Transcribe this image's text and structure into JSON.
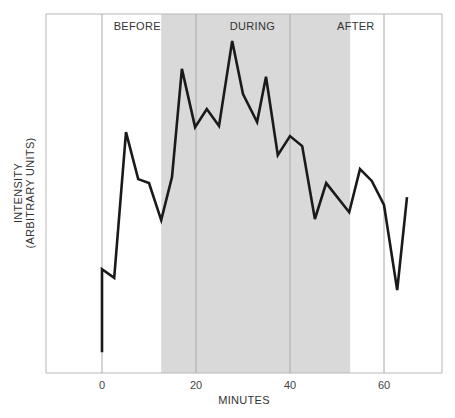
{
  "chart_data": {
    "type": "line",
    "title": "",
    "xlabel": "MINUTES",
    "ylabel": "INTENSITY",
    "ylabel_sub": "(ARBITRARY UNITS)",
    "xlim": [
      -12.5,
      72
    ],
    "ylim": [
      0,
      100
    ],
    "x_ticks": [
      0,
      20,
      40,
      60
    ],
    "y_ticks": [],
    "grid": "vertical lines at x ticks",
    "shaded_region": {
      "label": "DURING",
      "x_start": 12.6,
      "x_end": 52.8,
      "color": "#d9d9d9"
    },
    "phases": [
      {
        "label": "BEFORE",
        "x_center": 7.5
      },
      {
        "label": "DURING",
        "x_center": 32
      },
      {
        "label": "AFTER",
        "x_center": 54
      }
    ],
    "series": [
      {
        "name": "Intensity",
        "color": "#1a1a1a",
        "x": [
          0,
          0,
          2.6,
          5.1,
          7.7,
          10.0,
          12.6,
          14.9,
          17.0,
          19.8,
          22.3,
          24.9,
          27.7,
          30.0,
          33.0,
          34.9,
          37.4,
          40.0,
          42.6,
          45.3,
          47.7,
          52.6,
          54.9,
          57.4,
          60.0,
          62.8,
          64.9
        ],
        "values": [
          5.8,
          28.9,
          26.5,
          67.1,
          54.0,
          52.9,
          42.6,
          54.6,
          84.7,
          68.5,
          73.5,
          68.8,
          92.5,
          77.7,
          69.9,
          82.5,
          60.7,
          66.0,
          63.2,
          42.9,
          52.9,
          44.8,
          56.8,
          53.5,
          46.8,
          23.1,
          49.0
        ]
      }
    ]
  }
}
